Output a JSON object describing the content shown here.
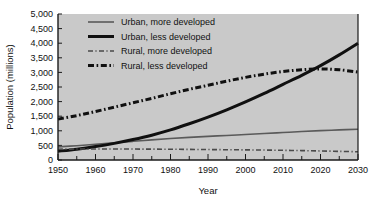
{
  "chart_data": {
    "type": "line",
    "title": "",
    "subtitle": "",
    "xlabel": "Year",
    "ylabel": "Population (millions)",
    "xlim": [
      1950,
      2030
    ],
    "ylim": [
      0,
      5000
    ],
    "ytick_step": 500,
    "xtick_step": 10,
    "x_minor_step": 5,
    "grid": false,
    "legend_position": "top-left-inside",
    "plot_background": "#c9c9c9",
    "figure_background": "#ffffff",
    "axis_color": "#1a1a1a",
    "xticks": [
      1950,
      1960,
      1970,
      1980,
      1990,
      2000,
      2010,
      2020,
      2030
    ],
    "xtick_labels": [
      "1950",
      "1960",
      "1970",
      "1980",
      "1990",
      "2000",
      "2010",
      "2020",
      "2030"
    ],
    "yticks": [
      0,
      500,
      1000,
      1500,
      2000,
      2500,
      3000,
      3500,
      4000,
      4500,
      5000
    ],
    "ytick_labels": [
      "0",
      "500",
      "1,000",
      "1,500",
      "2,000",
      "2,500",
      "3,000",
      "3,500",
      "4,000",
      "4,500",
      "5,000"
    ],
    "x": [
      1950,
      1955,
      1960,
      1965,
      1970,
      1975,
      1980,
      1985,
      1990,
      1995,
      2000,
      2005,
      2010,
      2015,
      2020,
      2025,
      2030
    ],
    "series": [
      {
        "name": "Urban, more developed",
        "color": "#5a5a5a",
        "style": "solid",
        "width": 1.6,
        "values": [
          450,
          490,
          540,
          590,
          640,
          690,
          735,
          775,
          810,
          840,
          875,
          905,
          940,
          975,
          1005,
          1030,
          1055
        ]
      },
      {
        "name": "Urban, less developed",
        "color": "#101010",
        "style": "solid",
        "width": 3.0,
        "values": [
          300,
          370,
          460,
          570,
          700,
          850,
          1030,
          1240,
          1470,
          1720,
          1990,
          2280,
          2590,
          2900,
          3230,
          3600,
          4000
        ]
      },
      {
        "name": "Rural, more developed",
        "color": "#4a4a4a",
        "style": "dashdot",
        "width": 1.6,
        "values": [
          370,
          375,
          378,
          378,
          375,
          372,
          368,
          363,
          358,
          352,
          347,
          340,
          332,
          322,
          310,
          296,
          282
        ]
      },
      {
        "name": "Rural, less developed",
        "color": "#101010",
        "style": "dashdot",
        "width": 3.0,
        "values": [
          1400,
          1520,
          1660,
          1810,
          1960,
          2110,
          2270,
          2420,
          2560,
          2700,
          2830,
          2940,
          3030,
          3090,
          3120,
          3090,
          3010
        ]
      }
    ],
    "legend": [
      {
        "label": "Urban, more developed",
        "color": "#5a5a5a",
        "style": "solid",
        "width": 1.6
      },
      {
        "label": "Urban, less developed",
        "color": "#101010",
        "style": "solid",
        "width": 3.0
      },
      {
        "label": "Rural, more developed",
        "color": "#4a4a4a",
        "style": "dashdot",
        "width": 1.6
      },
      {
        "label": "Rural, less developed",
        "color": "#101010",
        "style": "dashdot",
        "width": 3.0
      }
    ]
  }
}
